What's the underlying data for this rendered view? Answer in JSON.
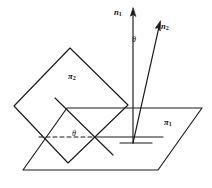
{
  "figure": {
    "kind": "geometry-diagram",
    "background_color": "#ffffff",
    "line_color": "#1a1a1a",
    "width": 212,
    "height": 188
  },
  "labels": {
    "normal_1": {
      "base": "n",
      "subscript": "1",
      "text": "n1",
      "x": 114,
      "y": 8
    },
    "normal_2": {
      "base": "n",
      "subscript": "2",
      "text": "n2",
      "x": 161,
      "y": 22
    },
    "plane_1": {
      "base": "π",
      "subscript": "1",
      "text": "π1",
      "x": 164,
      "y": 118
    },
    "plane_2": {
      "base": "π",
      "subscript": "2",
      "text": "π2",
      "x": 68,
      "y": 72
    },
    "angle_top": {
      "text": "θ",
      "x": 132,
      "y": 36
    },
    "angle_bottom": {
      "text": "θ",
      "x": 72,
      "y": 130
    }
  },
  "geometry": {
    "plane_1_polygon": "23,170 158,170 202,108 67,108",
    "plane_2_polygon": "14,106 70,48 128,105 68,163",
    "normal_1_line": {
      "x1": 133,
      "y1": 143,
      "x2": 133,
      "y2": 13
    },
    "normal_2_line": {
      "x1": 133,
      "y1": 143,
      "x2": 159,
      "y2": 27
    },
    "intersection_line": {
      "x1": 95,
      "y1": 137,
      "x2": 163,
      "y2": 137
    },
    "dashed_line": {
      "x1": 39,
      "y1": 137,
      "x2": 95,
      "y2": 137
    },
    "in_plane_line": {
      "x1": 55,
      "y1": 98,
      "x2": 113,
      "y2": 155
    },
    "foot_mark": {
      "x1": 120,
      "y1": 143,
      "x2": 152,
      "y2": 143
    },
    "upper_edge_segment": {
      "x1": 128,
      "y1": 105,
      "x2": 133,
      "y2": 105
    }
  },
  "colors": {
    "stroke": "#1a1a1a",
    "text": "#111111",
    "background": "#ffffff"
  }
}
